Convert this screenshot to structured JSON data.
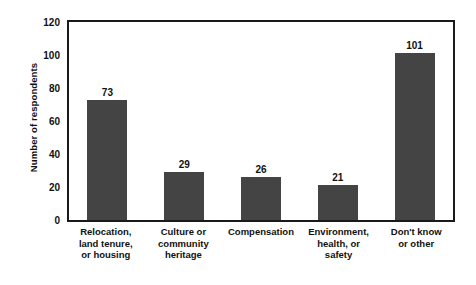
{
  "chart_data": {
    "type": "bar",
    "title": "",
    "xlabel": "",
    "ylabel": "Number of respondents",
    "categories": [
      "Relocation, land tenure, or housing",
      "Culture or community heritage",
      "Compensation",
      "Environment, health, or safety",
      "Don't know or other"
    ],
    "category_lines": [
      [
        "Relocation,",
        "land tenure,",
        "or housing"
      ],
      [
        "Culture or",
        "community",
        "heritage"
      ],
      [
        "Compensation"
      ],
      [
        "Environment,",
        "health, or",
        "safety"
      ],
      [
        "Don't know",
        "or other"
      ]
    ],
    "values": [
      73,
      29,
      26,
      21,
      101
    ],
    "value_labels": [
      "73",
      "29",
      "26",
      "21",
      "101"
    ],
    "ylim": [
      0,
      120
    ],
    "yticks": [
      0,
      20,
      40,
      60,
      80,
      100,
      120
    ],
    "ytick_labels": [
      "0",
      "20",
      "40",
      "60",
      "80",
      "100",
      "120"
    ],
    "grid": false,
    "legend": "none",
    "bar_color": "#444444",
    "axis_color": "#1a1a1a",
    "background_color": "#ffffff",
    "text_color": "#111111"
  }
}
